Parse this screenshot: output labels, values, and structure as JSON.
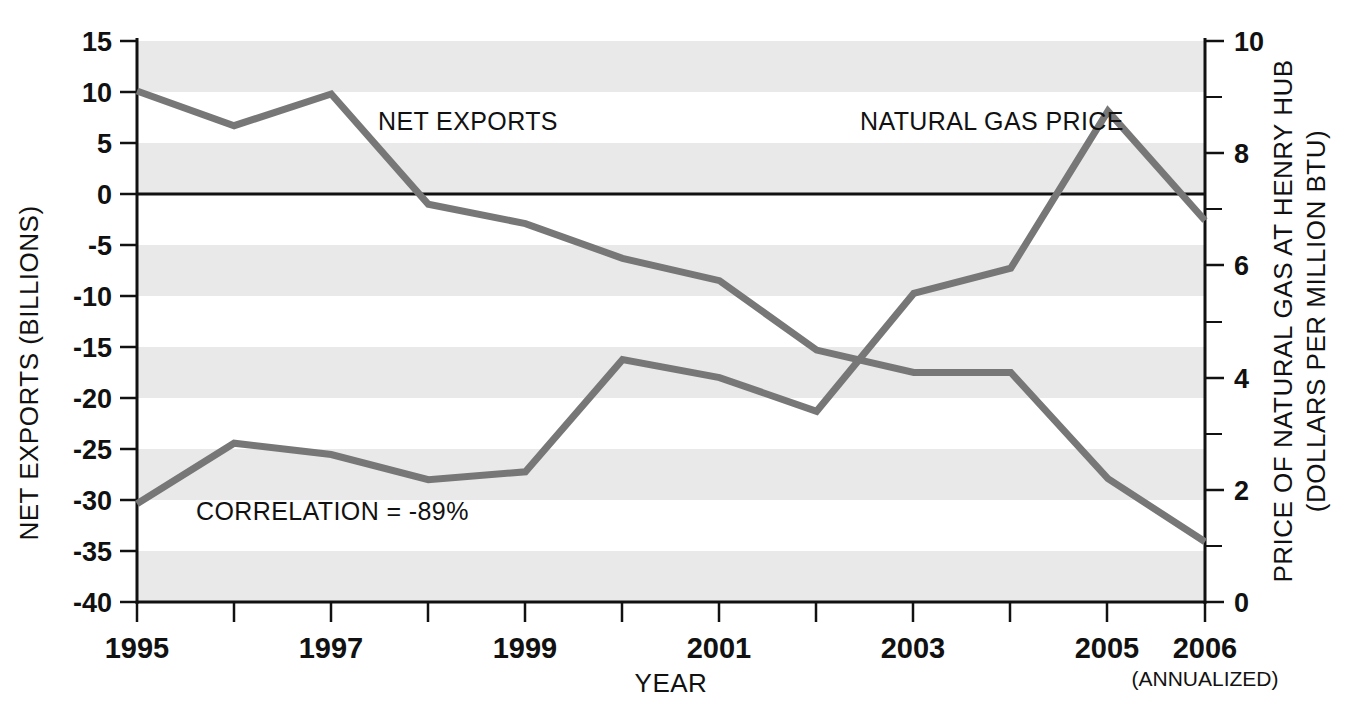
{
  "chart_data": {
    "type": "line",
    "title": "",
    "xlabel": "YEAR",
    "x": [
      1995,
      1996,
      1997,
      1998,
      1999,
      2000,
      2001,
      2002,
      2003,
      2004,
      2005,
      2006
    ],
    "xtick_labels": [
      "1995",
      "",
      "1997",
      "",
      "1999",
      "",
      "2001",
      "",
      "2003",
      "",
      "2005",
      "2006"
    ],
    "x_note": "(ANNUALIZED)",
    "grid": "horizontal alternating shaded bands every 5 units of left axis",
    "legend_position": "inline labels on plot",
    "axes": {
      "left": {
        "label": "NET EXPORTS (BILLIONS)",
        "ylim": [
          -40,
          15
        ],
        "ticks": [
          15,
          10,
          5,
          0,
          -5,
          -10,
          -15,
          -20,
          -25,
          -30,
          -35,
          -40
        ],
        "tick_labels": [
          "15",
          "10",
          "5",
          "0",
          "-5",
          "-10",
          "-15",
          "-20",
          "-25",
          "-30",
          "-35",
          "-40"
        ]
      },
      "right": {
        "label": "PRICE OF NATURAL GAS AT HENRY HUB",
        "label2": "(DOLLARS PER MILLION BTU)",
        "ylim": [
          0,
          10
        ],
        "ticks": [
          10,
          9,
          8,
          7,
          6,
          5,
          4,
          3,
          2,
          1,
          0
        ],
        "major_ticks": [
          10,
          8,
          6,
          4,
          2,
          0
        ],
        "tick_labels": [
          "10",
          "8",
          "6",
          "4",
          "2",
          "0"
        ]
      }
    },
    "series": [
      {
        "name": "NET EXPORTS",
        "axis": "left",
        "label": "NET EXPORTS",
        "color": "#777777",
        "values": [
          10.1,
          6.7,
          9.8,
          -1.0,
          -2.9,
          -6.3,
          -8.5,
          -15.3,
          -17.5,
          -17.5,
          -27.9,
          -34.1
        ]
      },
      {
        "name": "NATURAL GAS PRICE",
        "axis": "right",
        "label": "NATURAL GAS PRICE",
        "color": "#777777",
        "values": [
          1.75,
          2.83,
          2.63,
          2.18,
          2.32,
          4.32,
          4.0,
          3.4,
          5.5,
          5.95,
          8.75,
          6.8
        ]
      }
    ],
    "annotations": [
      {
        "text": "CORRELATION = -89%",
        "x": 1996.5,
        "y_left": -31.5
      }
    ]
  }
}
